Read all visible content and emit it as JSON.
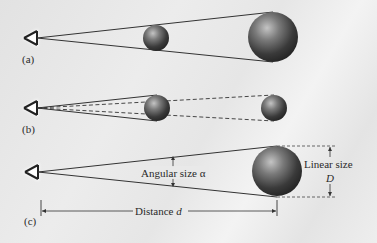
{
  "panels": {
    "a": {
      "label": "(a)"
    },
    "b": {
      "label": "(b)"
    },
    "c": {
      "label": "(c)",
      "angular_size_label": "Angular size α",
      "linear_size_label": "Linear size",
      "linear_size_symbol": "D",
      "distance_label": "Distance",
      "distance_symbol": "d"
    }
  },
  "colors": {
    "background": "#e9e9e9",
    "line": "#2a2a2a",
    "sphere_dark": "#2e2e2e",
    "sphere_light": "#b5b5b5"
  }
}
